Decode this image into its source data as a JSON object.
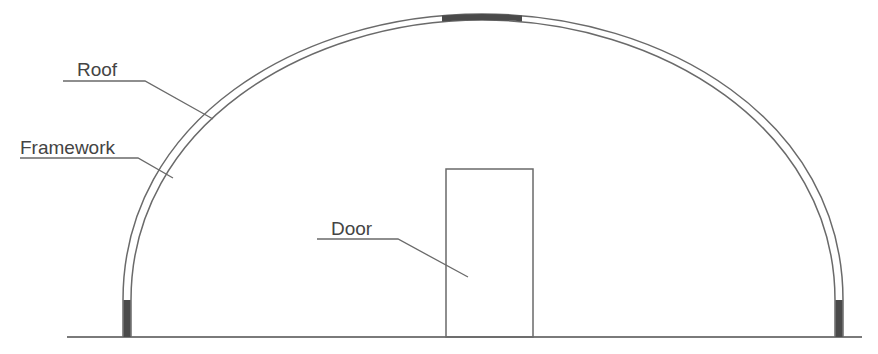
{
  "diagram": {
    "type": "greenhouse-arch-elevation",
    "labels": {
      "roof": "Roof",
      "framework": "Framework",
      "door": "Door"
    },
    "colors": {
      "line": "#6a6a6a",
      "dark_fill": "#4a4a4a",
      "text": "#444444",
      "background": "#ffffff"
    }
  }
}
